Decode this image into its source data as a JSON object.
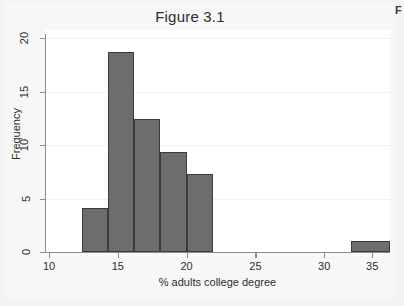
{
  "corner_mark": "F",
  "chart_data": {
    "type": "bar",
    "title": "Figure 3.1",
    "xlabel": "% adults college degree",
    "ylabel": "Frequency",
    "xlim": [
      10,
      36
    ],
    "ylim": [
      0,
      20
    ],
    "grid": true,
    "legend": "none",
    "bin_width": 2,
    "categories": [
      "12.5-14.5",
      "14.5-16.5",
      "16.5-18.5",
      "18.5-20.5",
      "20.5-22.5",
      "33-36"
    ],
    "bins": [
      {
        "start": 12.5,
        "end": 14.5,
        "value": 4
      },
      {
        "start": 14.5,
        "end": 16.5,
        "value": 18
      },
      {
        "start": 16.5,
        "end": 18.5,
        "value": 12
      },
      {
        "start": 18.5,
        "end": 20.5,
        "value": 9
      },
      {
        "start": 20.5,
        "end": 22.5,
        "value": 7
      },
      {
        "start": 33.0,
        "end": 36.0,
        "value": 1
      }
    ],
    "values": [
      4,
      18,
      12,
      9,
      7,
      1
    ],
    "xticks": [
      10,
      15,
      20,
      25,
      30,
      35
    ],
    "yticks": [
      0,
      5,
      10,
      15,
      20
    ],
    "bar_color": "#6d6d6d",
    "bar_edge_color": "#3b3b3b",
    "plot_background": "#ffffff",
    "page_background": "#f3f3f3",
    "axis_color": "#8e8e8e",
    "gridline_color": "#f0f0f0"
  }
}
